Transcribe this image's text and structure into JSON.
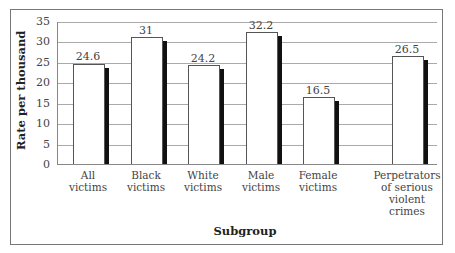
{
  "chart_data": {
    "type": "bar",
    "title": "",
    "xlabel": "Subgroup",
    "ylabel": "Rate per thousand",
    "ylim": [
      0,
      35
    ],
    "yticks": [
      0,
      5,
      10,
      15,
      20,
      25,
      30,
      35
    ],
    "grid": true,
    "legend": null,
    "categories": [
      "All victims",
      "Black victims",
      "White victims",
      "Male victims",
      "Female victims",
      "Perpetrators of serious violent crimes"
    ],
    "values": [
      24.6,
      31,
      24.2,
      32.2,
      16.5,
      26.5
    ],
    "value_labels": [
      "24.6",
      "31",
      "24.2",
      "32.2",
      "16.5",
      "26.5"
    ]
  },
  "axis": {
    "ylabel": "Rate per thousand",
    "xlabel": "Subgroup",
    "yticks": [
      "0",
      "5",
      "10",
      "15",
      "20",
      "25",
      "30",
      "35"
    ]
  },
  "bars": [
    {
      "value_label": "24.6",
      "label_lines": [
        "All",
        "victims"
      ]
    },
    {
      "value_label": "31",
      "label_lines": [
        "Black",
        "victims"
      ]
    },
    {
      "value_label": "24.2",
      "label_lines": [
        "White",
        "victims"
      ]
    },
    {
      "value_label": "32.2",
      "label_lines": [
        "Male",
        "victims"
      ]
    },
    {
      "value_label": "16.5",
      "label_lines": [
        "Female",
        "victims"
      ]
    },
    {
      "value_label": "26.5",
      "label_lines": [
        "Perpetrators",
        "of serious",
        "violent",
        "crimes"
      ]
    }
  ]
}
